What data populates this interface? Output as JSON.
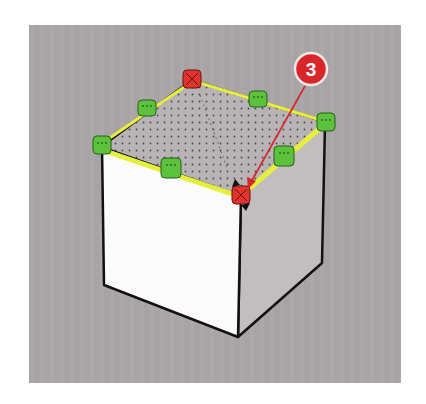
{
  "viewport": {
    "description": "3D modeling viewport showing a selected cube with top-face grips",
    "background_color": "#a8a3a5"
  },
  "model": {
    "name": "cube",
    "top_face_pattern": "dotted",
    "selected_edge_color": "#e6ef3c",
    "edge_color": "#111111",
    "front_face_color": "#fbfbfb",
    "side_face_color": "#c2bec0",
    "top_face_color": "#b5b1b4"
  },
  "grips": {
    "midpoint_color": "#5cc13b",
    "corner_color": "#e0352e",
    "items": [
      {
        "name": "grip-top-back-corner",
        "type": "corner",
        "active": true
      },
      {
        "name": "grip-front-corner",
        "type": "corner",
        "active": true
      },
      {
        "name": "grip-left-corner",
        "type": "midpoint"
      },
      {
        "name": "grip-back-left-midpoint",
        "type": "midpoint"
      },
      {
        "name": "grip-back-right-midpoint",
        "type": "midpoint"
      },
      {
        "name": "grip-right-corner",
        "type": "midpoint"
      },
      {
        "name": "grip-front-left-midpoint",
        "type": "midpoint"
      },
      {
        "name": "grip-front-right-midpoint",
        "type": "midpoint"
      }
    ]
  },
  "callout": {
    "number": "3",
    "color": "#d8262b",
    "target": "grip-front-corner"
  },
  "cursor": {
    "type": "move-cursor-icon"
  }
}
